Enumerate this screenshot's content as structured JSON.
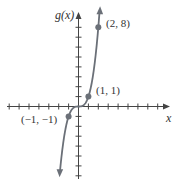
{
  "chart_data": {
    "type": "line",
    "title": "",
    "function": "g(x) = x^3",
    "xlabel": "x",
    "ylabel": "g(x)",
    "xlim": [
      -7,
      9
    ],
    "ylim": [
      -7,
      9
    ],
    "grid": false,
    "x_tick_step": 1,
    "y_tick_step": 1,
    "points": [
      {
        "x": -1,
        "y": -1,
        "label": "(−1, −1)"
      },
      {
        "x": 1,
        "y": 1,
        "label": "(1, 1)"
      },
      {
        "x": 2,
        "y": 8,
        "label": "(2, 8)"
      }
    ],
    "curve_color": "#6b7078"
  },
  "labels": {
    "y_axis": "g(x)",
    "x_axis": "x",
    "p1": "(2, 8)",
    "p2": "(1, 1)",
    "p3": "(−1, −1)"
  }
}
